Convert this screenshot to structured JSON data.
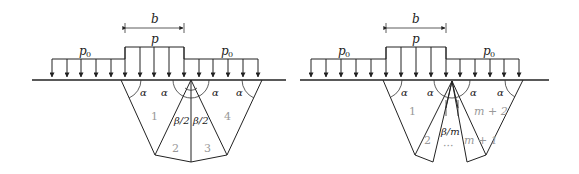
{
  "left_panel": {
    "width_label": "b",
    "load_label": "p",
    "surcharge_left_label": "p",
    "surcharge_left_sub": "0",
    "surcharge_right_label": "p",
    "surcharge_right_sub": "0",
    "angle_labels": [
      "α",
      "α",
      "α",
      "α"
    ],
    "fan_angle_left": "β/2",
    "fan_angle_right": "β/2",
    "regions": [
      "1",
      "2",
      "3",
      "4"
    ]
  },
  "right_panel": {
    "width_label": "b",
    "load_label": "p",
    "surcharge_left_label": "p",
    "surcharge_left_sub": "0",
    "surcharge_right_label": "p",
    "surcharge_right_sub": "0",
    "angle_labels": [
      "α",
      "α",
      "α",
      "α"
    ],
    "fan_angle": "β/m",
    "ellipsis": "···",
    "regions": [
      "1",
      "2",
      "m + 1",
      "m + 2"
    ]
  },
  "colors": {
    "line": "#222222",
    "region_label": "#999999",
    "background": "#ffffff"
  }
}
